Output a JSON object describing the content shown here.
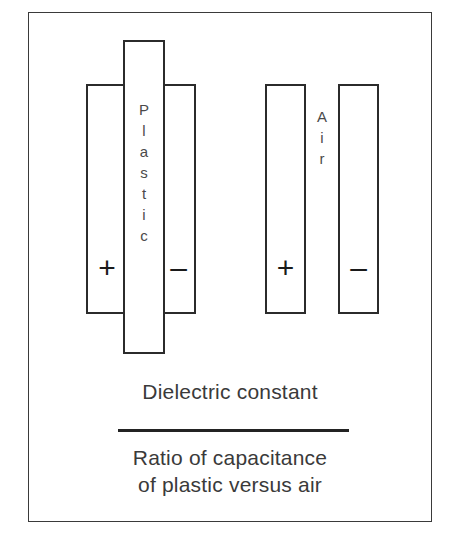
{
  "diagram": {
    "frame_color": "#3a3a3a",
    "line_color": "#2b2b2b"
  },
  "capacitors": [
    {
      "id": "plastic-capacitor",
      "dielectric_label": "Plastic",
      "dielectric_letters": [
        "P",
        "l",
        "a",
        "s",
        "t",
        "i",
        "c"
      ],
      "positive_sign": "+",
      "negative_sign": "–"
    },
    {
      "id": "air-capacitor",
      "dielectric_label": "Air",
      "dielectric_letters": [
        "A",
        "i",
        "r"
      ],
      "positive_sign": "+",
      "negative_sign": "–"
    }
  ],
  "formula": {
    "numerator": "Dielectric constant",
    "denominator_line1": "Ratio of capacitance",
    "denominator_line2": "of plastic versus air"
  }
}
